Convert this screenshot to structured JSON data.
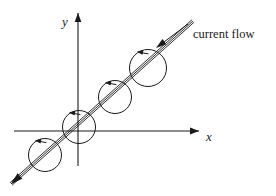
{
  "figure": {
    "kind": "physics-line-diagram",
    "background_color": "#ffffff",
    "ink_color": "#1a1a1a",
    "width": 276,
    "height": 196
  },
  "axes": {
    "x_axis": {
      "label": "x",
      "label_x": 206,
      "label_y": 141,
      "start_x": 14,
      "start_y": 131,
      "end_x": 199,
      "end_y": 131,
      "arrow_at": "end",
      "name": "x-axis"
    },
    "y_axis": {
      "label": "y",
      "label_x": 62,
      "label_y": 26,
      "start_x": 78,
      "start_y": 166,
      "end_x": 78,
      "end_y": 13,
      "arrow_at": "end",
      "name": "y-axis"
    },
    "origin": {
      "x": 78,
      "y": 131
    }
  },
  "wire": {
    "description": "current carrying wire",
    "start_x": 11,
    "start_y": 184,
    "end_x": 193,
    "end_y": 21,
    "arrow_at": "start",
    "double_line_offset": 1.6
  },
  "field_loops": [
    {
      "id": "loop-1",
      "cx": 45,
      "cy": 155,
      "r": 16.5,
      "squash": 1.0,
      "rotation": 45
    },
    {
      "id": "loop-2",
      "cx": 79,
      "cy": 127,
      "r": 16.5,
      "squash": 1.0,
      "rotation": 45
    },
    {
      "id": "loop-3",
      "cx": 115,
      "cy": 97,
      "r": 16.5,
      "squash": 1.0,
      "rotation": 45
    },
    {
      "id": "loop-4",
      "cx": 148,
      "cy": 68,
      "r": 18.5,
      "squash": 1.0,
      "rotation": 45
    }
  ],
  "annotation": {
    "text": "current flow",
    "text_x": 193,
    "text_y": 38,
    "leader": {
      "from_x": 188,
      "from_y": 24,
      "to_x": 156,
      "to_y": 48,
      "arrow_at": "to"
    }
  }
}
